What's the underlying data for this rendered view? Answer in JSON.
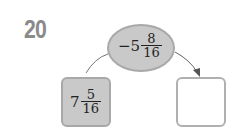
{
  "problem": {
    "number": "20",
    "operator": {
      "sign": "−",
      "whole": "5",
      "numerator": "8",
      "denominator": "16"
    },
    "start_value": {
      "whole": "7",
      "numerator": "5",
      "denominator": "16"
    },
    "answer_box": ""
  },
  "colors": {
    "shape_fill": "#c9c9c9",
    "shape_border": "#a9a9a9",
    "number_label": "#8a8a8a",
    "arrow": "#666666"
  }
}
